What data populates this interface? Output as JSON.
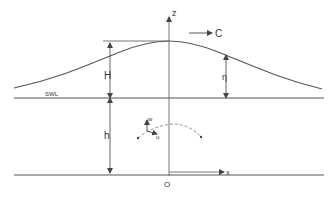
{
  "diagram": {
    "labels": {
      "z_axis": "z",
      "x_axis": "x",
      "origin": "O",
      "celerity": "C",
      "wave_height": "H",
      "surface_elevation": "η",
      "still_water_level": "SWL",
      "water_depth": "h",
      "vertical_velocity": "w",
      "horizontal_velocity": "u"
    },
    "colors": {
      "line": "#555555",
      "text": "#333333",
      "background": "#ffffff"
    }
  }
}
